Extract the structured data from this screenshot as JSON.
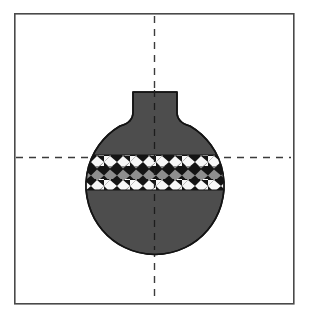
{
  "figure": {
    "title": "Ceramic vessel profile drawing",
    "canvas": {
      "width": 310,
      "height": 317,
      "background": "#ffffff"
    }
  },
  "frame": {
    "name": "plate-border",
    "x": 14,
    "y": 13,
    "width": 279,
    "height": 290,
    "stroke": "#4a4a4a",
    "stroke_width": 1.6,
    "fill": "#ffffff"
  },
  "axes": {
    "stroke": "#3b3b3b",
    "stroke_width": 1.4,
    "dash": "7,6",
    "vertical": {
      "x": 154.5,
      "y1": 16,
      "y2": 301
    },
    "horizontal": {
      "y": 157.5,
      "x1": 16,
      "x2": 291
    }
  },
  "vessel": {
    "name": "ceramic-vessel",
    "body_fill": "#4d4d4d",
    "outline": "#141414",
    "outline_width": 1.6,
    "body_circle": {
      "cx": 155,
      "cy": 178,
      "r": 69
    },
    "neck": {
      "top_y": 92,
      "left_x": 133,
      "right_x": 177,
      "rim_width": 44,
      "shoulder_y": 126
    }
  },
  "decoration_band": {
    "name": "lattice-band",
    "top_y": 155,
    "bottom_y": 190,
    "height": 35,
    "rows": 3,
    "motif": "diagonal checkerboard lattice",
    "colors": {
      "light": "#f7f7f7",
      "dark": "#141414",
      "mid": "#8e8e8e"
    },
    "cell_width": 13,
    "row_colors": [
      "light-dark",
      "mid-dark",
      "light-dark"
    ]
  },
  "chart_data": {
    "type": "scatter",
    "title": "Ceramic vessel profile drawing",
    "xlabel": "",
    "ylabel": ""
  }
}
